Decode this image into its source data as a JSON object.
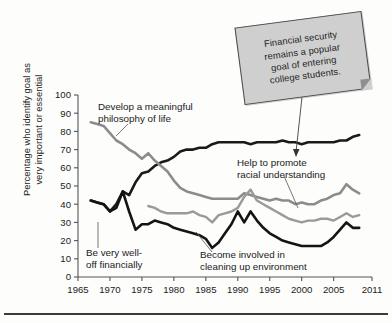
{
  "figure": {
    "callout": {
      "lines": [
        "Financial security",
        "remains a popular",
        "goal of entering",
        "college students."
      ],
      "full_text": "Financial security remains a popular goal of entering college students.",
      "bg_color": "#cfcfcf",
      "border_color": "#4a4a4a"
    },
    "y_axis_title_line1": "Percentage who identify goal as",
    "y_axis_title_line2": "very important or essential"
  },
  "annotations": [
    {
      "id": "philosophy",
      "lines": [
        "Develop a meaningful",
        "philosophy of life"
      ]
    },
    {
      "id": "financial",
      "lines": [
        "Be very well-",
        "off financially"
      ]
    },
    {
      "id": "racial",
      "lines": [
        "Help to promote",
        "racial understanding"
      ]
    },
    {
      "id": "environment",
      "lines": [
        "Become involved in",
        "cleaning up environment"
      ]
    }
  ],
  "chart_data": {
    "type": "line",
    "title": "",
    "subtitle": "",
    "xlabel": "",
    "ylabel": "Percentage who identify goal as very important or essential",
    "xlim": [
      1965,
      2011
    ],
    "ylim": [
      0,
      100
    ],
    "ytick_labels": [
      "0",
      "10",
      "20",
      "30",
      "40",
      "50",
      "60",
      "70",
      "80",
      "90",
      "100"
    ],
    "ytick_values": [
      0,
      10,
      20,
      30,
      40,
      50,
      60,
      70,
      80,
      90,
      100
    ],
    "xtick_labels": [
      "1965",
      "1970",
      "1975",
      "1980",
      "1985",
      "1990",
      "1995",
      "2000",
      "2005",
      "2011"
    ],
    "xtick_values": [
      1965,
      1970,
      1975,
      1980,
      1985,
      1990,
      1995,
      2000,
      2005,
      2011
    ],
    "grid": false,
    "legend": "annotations-inline",
    "series": [
      {
        "name": "Be very well-off financially",
        "color": "#1a1a1a",
        "width": 2.6,
        "x": [
          1967,
          1968,
          1969,
          1970,
          1971,
          1972,
          1973,
          1974,
          1975,
          1976,
          1977,
          1978,
          1979,
          1980,
          1981,
          1982,
          1983,
          1984,
          1985,
          1986,
          1987,
          1988,
          1989,
          1990,
          1991,
          1992,
          1993,
          1994,
          1995,
          1996,
          1997,
          1998,
          1999,
          2000,
          2001,
          2002,
          2003,
          2004,
          2005,
          2006,
          2007,
          2008,
          2009
        ],
        "y": [
          42,
          41,
          40,
          36,
          40,
          47,
          45,
          52,
          57,
          58,
          61,
          63,
          64,
          66,
          69,
          70,
          70,
          71,
          71,
          73,
          74,
          74,
          74,
          74,
          74,
          73,
          74,
          74,
          74,
          74,
          75,
          74,
          74,
          73,
          74,
          74,
          74,
          74,
          74,
          75,
          75,
          77,
          78
        ]
      },
      {
        "name": "Develop a meaningful philosophy of life",
        "color": "#8c8c8c",
        "width": 2.6,
        "x": [
          1967,
          1968,
          1969,
          1970,
          1971,
          1972,
          1973,
          1974,
          1975,
          1976,
          1977,
          1978,
          1979,
          1980,
          1981,
          1982,
          1983,
          1984,
          1985,
          1986,
          1987,
          1988,
          1989,
          1990,
          1991,
          1992,
          1993,
          1994,
          1995,
          1996,
          1997,
          1998,
          1999,
          2000,
          2001,
          2002,
          2003,
          2004,
          2005,
          2006,
          2007,
          2008,
          2009
        ],
        "y": [
          85,
          84,
          83,
          79,
          75,
          73,
          70,
          68,
          65,
          68,
          64,
          61,
          58,
          53,
          49,
          47,
          46,
          45,
          44,
          43,
          43,
          43,
          43,
          43,
          46,
          45,
          44,
          43,
          42,
          43,
          42,
          42,
          40,
          41,
          40,
          40,
          42,
          43,
          45,
          46,
          51,
          48,
          46
        ]
      },
      {
        "name": "Help to promote racial understanding",
        "color": "#9a9a9a",
        "width": 2.4,
        "x": [
          1976,
          1977,
          1978,
          1979,
          1980,
          1981,
          1982,
          1983,
          1984,
          1985,
          1986,
          1987,
          1988,
          1989,
          1990,
          1991,
          1992,
          1993,
          1994,
          1995,
          1996,
          1997,
          1998,
          1999,
          2000,
          2001,
          2002,
          2003,
          2004,
          2005,
          2006,
          2007,
          2008,
          2009
        ],
        "y": [
          39,
          38,
          36,
          35,
          35,
          35,
          35,
          36,
          34,
          33,
          30,
          34,
          35,
          36,
          38,
          44,
          48,
          42,
          40,
          38,
          36,
          34,
          32,
          31,
          30,
          31,
          31,
          32,
          32,
          31,
          33,
          35,
          33,
          34
        ]
      },
      {
        "name": "Become involved in cleaning up environment",
        "color": "#141414",
        "width": 2.6,
        "x": [
          1967,
          1968,
          1969,
          1970,
          1971,
          1972,
          1973,
          1974,
          1975,
          1976,
          1977,
          1978,
          1979,
          1980,
          1981,
          1982,
          1983,
          1984,
          1985,
          1986,
          1987,
          1988,
          1989,
          1990,
          1991,
          1992,
          1993,
          1994,
          1995,
          1996,
          1997,
          1998,
          1999,
          2000,
          2001,
          2002,
          2003,
          2004,
          2005,
          2006,
          2007,
          2008,
          2009
        ],
        "y": [
          42,
          41,
          40,
          36,
          38,
          47,
          36,
          26,
          29,
          29,
          31,
          30,
          29,
          27,
          26,
          25,
          24,
          23,
          21,
          16,
          19,
          24,
          29,
          36,
          30,
          36,
          31,
          27,
          24,
          22,
          20,
          19,
          18,
          17,
          17,
          17,
          17,
          19,
          22,
          26,
          30,
          27,
          27
        ]
      }
    ]
  }
}
